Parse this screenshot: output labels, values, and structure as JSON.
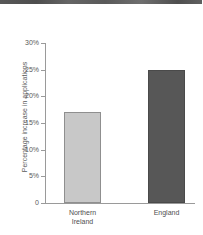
{
  "chart_data": {
    "type": "bar",
    "title": "",
    "xlabel": "",
    "ylabel": "Percentage increase in applications",
    "ylim": [
      0,
      30
    ],
    "grid": false,
    "legend": "none",
    "categories": [
      "Northern Ireland",
      "England"
    ],
    "values": [
      17,
      25
    ],
    "tick_labels": [
      "0",
      "5%",
      "10%",
      "15%",
      "20%",
      "25%",
      "30%"
    ],
    "tick_values": [
      0,
      5,
      10,
      15,
      20,
      25,
      30
    ],
    "series": [
      {
        "name": "Percentage increase in applications",
        "values": [
          17,
          25
        ]
      }
    ],
    "bars": [
      {
        "category": "Northern Ireland",
        "line1": "Northern",
        "line2": "Ireland",
        "value": 17,
        "color": "#c8c8c8",
        "edge": "#8f8f8f"
      },
      {
        "category": "England",
        "line1": "England",
        "line2": "",
        "value": 25,
        "color": "#575757",
        "edge": "#4a4a4a"
      }
    ],
    "colors": {
      "background": "#ffffff",
      "axis": "#9a9a9a",
      "text": "#5a5a5a",
      "bar_light": "#c8c8c8",
      "bar_dark": "#575757"
    }
  }
}
